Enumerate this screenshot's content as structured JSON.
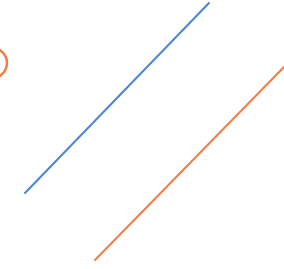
{
  "canvas": {
    "width": 284,
    "height": 269,
    "background": "#ffffff"
  },
  "colors": {
    "blue": "#4a86d8",
    "orange": "#ef7e45"
  },
  "shapes": {
    "blue_line": {
      "x1": 209,
      "y1": 3,
      "x2": 25,
      "y2": 193,
      "stroke": "#4a86d8",
      "width": 2
    },
    "orange_line": {
      "x1": 284,
      "y1": 67,
      "x2": 95,
      "y2": 260,
      "stroke": "#ef7e45",
      "width": 2
    },
    "orange_arc": {
      "cx": -8,
      "cy": 63,
      "r": 15,
      "stroke": "#ef7e45",
      "width": 2.5
    }
  }
}
